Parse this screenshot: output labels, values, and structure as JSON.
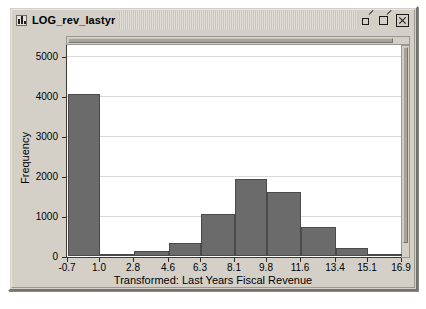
{
  "window": {
    "title": "LOG_rev_lastyr",
    "icon": "bar-chart-icon",
    "controls": [
      {
        "name": "minimize-button",
        "label": "Minimize"
      },
      {
        "name": "maximize-button",
        "label": "Maximize"
      },
      {
        "name": "close-button",
        "label": "Close"
      }
    ]
  },
  "colors": {
    "bar_fill": "#6b6b6b",
    "bar_stroke": "#4a4a4a",
    "plot_background": "#ffffff",
    "window_background": "#d4d0c8",
    "gridline": "#d9d9d9",
    "axis": "#3a3a3a"
  },
  "scrollbars": {
    "horizontal": "plot-hscrollbar",
    "vertical": "plot-vscrollbar"
  },
  "chart_data": {
    "type": "bar",
    "title": "",
    "xlabel": "Transformed: Last Years Fiscal Revenue",
    "ylabel": "Frequency",
    "xlim": [
      -0.7,
      16.9
    ],
    "ylim": [
      0,
      5300
    ],
    "grid": true,
    "legend": null,
    "xticks": [
      -0.7,
      1.0,
      2.8,
      4.6,
      6.3,
      8.1,
      9.8,
      11.6,
      13.4,
      15.1,
      16.9
    ],
    "xtick_labels": [
      "-0.7",
      "1.0",
      "2.8",
      "4.6",
      "6.3",
      "8.1",
      "9.8",
      "11.6",
      "13.4",
      "15.1",
      "16.9"
    ],
    "yticks": [
      0,
      1000,
      2000,
      3000,
      4000,
      5000
    ],
    "ytick_labels": [
      "0",
      "1000",
      "2000",
      "3000",
      "4000",
      "5000"
    ],
    "bin_edges": [
      -0.7,
      1.0,
      2.8,
      4.6,
      6.3,
      8.1,
      9.8,
      11.6,
      13.4,
      15.1,
      16.9
    ],
    "categories": [
      "-0.7 to 1.0",
      "1.0 to 2.8",
      "2.8 to 4.6",
      "4.6 to 6.3",
      "6.3 to 8.1",
      "8.1 to 9.8",
      "9.8 to 11.6",
      "11.6 to 13.4",
      "13.4 to 15.1",
      "15.1 to 16.9"
    ],
    "values": [
      4050,
      25,
      120,
      330,
      1050,
      1930,
      1600,
      720,
      190,
      15
    ]
  }
}
